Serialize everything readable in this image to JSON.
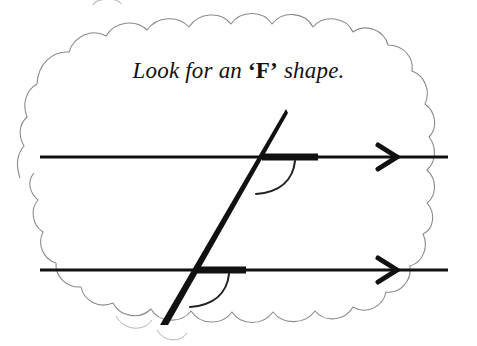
{
  "figure": {
    "title_text": "Look for an 'F' shape.",
    "caption": {
      "prefix": "Look for an ",
      "open_quote": "‘",
      "highlight_letter": "F",
      "close_quote": "’",
      "suffix": " shape."
    },
    "colors": {
      "background": "#ffffff",
      "ink": "#1a1a1a",
      "cloud_outline": "#8a8a8a",
      "line": "#111111"
    },
    "labels": {
      "cloud": "thought-bubble-cloud",
      "top_parallel_line": "top parallel line",
      "bottom_parallel_line": "bottom parallel line",
      "transversal_line": "transversal line",
      "top_arrow": "arrowhead right",
      "bottom_arrow": "arrowhead right",
      "top_angle_arc": "corresponding angle arc (upper)",
      "bottom_angle_arc": "corresponding angle arc (lower)",
      "top_thick_segment": "highlighted segment (upper)",
      "bottom_thick_segment": "highlighted segment (lower)"
    },
    "geometry": {
      "top_line": {
        "x1": 40,
        "y1": 157,
        "x2": 448,
        "y2": 157
      },
      "bottom_line": {
        "x1": 40,
        "y1": 270,
        "x2": 448,
        "y2": 270
      },
      "transversal": {
        "x1": 285,
        "y1": 110,
        "x2": 162,
        "y2": 325
      },
      "top_intersection": {
        "x": 263,
        "y": 157
      },
      "bottom_intersection": {
        "x": 198,
        "y": 270
      },
      "top_thick_segment": {
        "x1": 263,
        "y1": 157,
        "x2": 318,
        "y2": 157
      },
      "bottom_thick_segment": {
        "x1": 198,
        "y1": 270,
        "x2": 246,
        "y2": 270
      },
      "top_arrow_tip": {
        "x": 396,
        "y": 157
      },
      "bottom_arrow_tip": {
        "x": 396,
        "y": 270
      },
      "line_thin_width": 3,
      "line_thick_width": 6,
      "transversal_width": 5,
      "angle_arc_radius": 28
    }
  }
}
